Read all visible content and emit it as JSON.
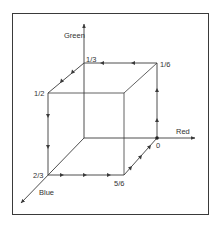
{
  "diagram": {
    "type": "rgb-color-cube-hue-path",
    "colors": {
      "line": "#3a3a3a",
      "text": "#333333",
      "background": "#ffffff"
    },
    "axes": [
      {
        "name": "green",
        "label": "Green"
      },
      {
        "name": "red",
        "label": "Red"
      },
      {
        "name": "blue",
        "label": "Blue"
      }
    ],
    "vertices": [
      {
        "id": "red",
        "label": "0"
      },
      {
        "id": "yellow",
        "label": "1/6"
      },
      {
        "id": "green",
        "label": "1/3"
      },
      {
        "id": "cyan",
        "label": "1/2"
      },
      {
        "id": "blue",
        "label": "2/3"
      },
      {
        "id": "magenta",
        "label": "5/6"
      }
    ],
    "path_order": [
      "0",
      "1/6",
      "1/3",
      "1/2",
      "2/3",
      "5/6",
      "0"
    ]
  }
}
